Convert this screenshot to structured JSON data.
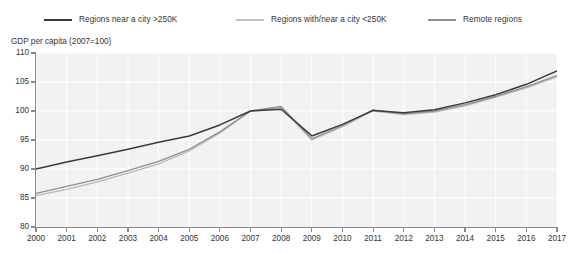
{
  "chart_data": {
    "type": "line",
    "title": "",
    "subtitle": "",
    "xlabel": "",
    "ylabel": "GDP per capita (2007=100)",
    "xlim": [
      2000,
      2017
    ],
    "ylim": [
      80,
      110
    ],
    "yticks": [
      80,
      85,
      90,
      95,
      100,
      105,
      110
    ],
    "grid": true,
    "grid_color": "#ffffff",
    "plot_background": "#f2f2f2",
    "legend_position": "top",
    "x": [
      2000,
      2001,
      2002,
      2003,
      2004,
      2005,
      2006,
      2007,
      2008,
      2009,
      2010,
      2011,
      2012,
      2013,
      2014,
      2015,
      2016,
      2017
    ],
    "categories": [
      "2000",
      "2001",
      "2002",
      "2003",
      "2004",
      "2005",
      "2006",
      "2007",
      "2008",
      "2009",
      "2010",
      "2011",
      "2012",
      "2013",
      "2014",
      "2015",
      "2016",
      "2017"
    ],
    "series": [
      {
        "name": "Regions near a city >250K",
        "color": "#3a3a3a",
        "values": [
          90.0,
          91.2,
          92.3,
          93.4,
          94.6,
          95.7,
          97.6,
          100.0,
          100.3,
          95.7,
          97.7,
          100.1,
          99.7,
          100.2,
          101.4,
          102.8,
          104.6,
          106.9
        ]
      },
      {
        "name": "Regions with/near a city <250K",
        "color": "#b8b8b8",
        "values": [
          85.4,
          86.5,
          87.8,
          89.3,
          90.9,
          93.1,
          96.2,
          100.0,
          100.6,
          95.0,
          97.3,
          100.0,
          99.4,
          99.8,
          100.9,
          102.4,
          104.0,
          105.9
        ]
      },
      {
        "name": "Remote regions",
        "color": "#8f8f8f",
        "values": [
          85.8,
          87.0,
          88.2,
          89.7,
          91.3,
          93.4,
          96.4,
          100.0,
          100.8,
          95.2,
          97.5,
          100.2,
          99.5,
          100.0,
          101.1,
          102.5,
          104.2,
          106.1
        ]
      }
    ]
  },
  "legend": {
    "items": [
      {
        "label": "Regions near a city >250K",
        "color": "#3a3a3a"
      },
      {
        "label": "Regions with/near a city <250K",
        "color": "#b8b8b8"
      },
      {
        "label": "Remote regions",
        "color": "#8f8f8f"
      }
    ]
  },
  "axes": {
    "ylabel": "GDP per capita (2007=100)",
    "ytick_labels": [
      "110",
      "105",
      "100",
      "95",
      "90",
      "85",
      "80"
    ],
    "xtick_labels": [
      "2000",
      "2001",
      "2002",
      "2003",
      "2004",
      "2005",
      "2006",
      "2007",
      "2008",
      "2009",
      "2010",
      "2011",
      "2012",
      "2013",
      "2014",
      "2015",
      "2016",
      "2017"
    ]
  }
}
